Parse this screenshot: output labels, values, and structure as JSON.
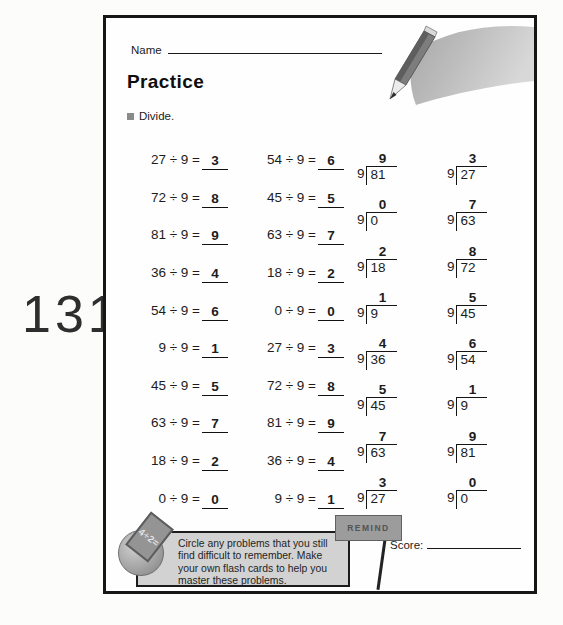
{
  "page_number": "131",
  "header": {
    "name_label": "Name",
    "title": "Practice",
    "instruction": "Divide."
  },
  "equation_rows": [
    {
      "left": {
        "expr": "27 ÷ 9 =",
        "answer": "3"
      },
      "right": {
        "expr": "54 ÷ 9 =",
        "answer": "6"
      }
    },
    {
      "left": {
        "expr": "72 ÷ 9 =",
        "answer": "8"
      },
      "right": {
        "expr": "45 ÷ 9 =",
        "answer": "5"
      }
    },
    {
      "left": {
        "expr": "81 ÷ 9 =",
        "answer": "9"
      },
      "right": {
        "expr": "63 ÷ 9 =",
        "answer": "7"
      }
    },
    {
      "left": {
        "expr": "36 ÷ 9 =",
        "answer": "4"
      },
      "right": {
        "expr": "18 ÷ 9 =",
        "answer": "2"
      }
    },
    {
      "left": {
        "expr": "54 ÷ 9 =",
        "answer": "6"
      },
      "right": {
        "expr": "0 ÷ 9 =",
        "answer": "0"
      }
    },
    {
      "left": {
        "expr": "9 ÷ 9 =",
        "answer": "1"
      },
      "right": {
        "expr": "27 ÷ 9 =",
        "answer": "3"
      }
    },
    {
      "left": {
        "expr": "45 ÷ 9 =",
        "answer": "5"
      },
      "right": {
        "expr": "72 ÷ 9 =",
        "answer": "8"
      }
    },
    {
      "left": {
        "expr": "63 ÷ 9 =",
        "answer": "7"
      },
      "right": {
        "expr": "81 ÷ 9 =",
        "answer": "9"
      }
    },
    {
      "left": {
        "expr": "18 ÷ 9 =",
        "answer": "2"
      },
      "right": {
        "expr": "36 ÷ 9 =",
        "answer": "4"
      }
    },
    {
      "left": {
        "expr": "0 ÷ 9 =",
        "answer": "0"
      },
      "right": {
        "expr": "9 ÷ 9 =",
        "answer": "1"
      }
    }
  ],
  "long_division_rows": [
    {
      "left": {
        "divisor": "9",
        "dividend": "81",
        "quotient": "9"
      },
      "right": {
        "divisor": "9",
        "dividend": "27",
        "quotient": "3"
      }
    },
    {
      "left": {
        "divisor": "9",
        "dividend": "0",
        "quotient": "0"
      },
      "right": {
        "divisor": "9",
        "dividend": "63",
        "quotient": "7"
      }
    },
    {
      "left": {
        "divisor": "9",
        "dividend": "18",
        "quotient": "2"
      },
      "right": {
        "divisor": "9",
        "dividend": "72",
        "quotient": "8"
      }
    },
    {
      "left": {
        "divisor": "9",
        "dividend": "9",
        "quotient": "1"
      },
      "right": {
        "divisor": "9",
        "dividend": "45",
        "quotient": "5"
      }
    },
    {
      "left": {
        "divisor": "9",
        "dividend": "36",
        "quotient": "4"
      },
      "right": {
        "divisor": "9",
        "dividend": "54",
        "quotient": "6"
      }
    },
    {
      "left": {
        "divisor": "9",
        "dividend": "45",
        "quotient": "5"
      },
      "right": {
        "divisor": "9",
        "dividend": "9",
        "quotient": "1"
      }
    },
    {
      "left": {
        "divisor": "9",
        "dividend": "63",
        "quotient": "7"
      },
      "right": {
        "divisor": "9",
        "dividend": "81",
        "quotient": "9"
      }
    },
    {
      "left": {
        "divisor": "9",
        "dividend": "27",
        "quotient": "3"
      },
      "right": {
        "divisor": "9",
        "dividend": "0",
        "quotient": "0"
      }
    }
  ],
  "footer": {
    "note": "Circle any problems that you still find difficult to remember. Make your own flash cards to help you master these problems.",
    "badge_text": "4÷2=",
    "sign_text": "REMIND",
    "score_label": "Score:"
  },
  "icons": {
    "pencil": "pencil-swoosh-illustration",
    "bullet": "square-bullet",
    "badge": "flash-card-ball-badge",
    "sign": "remind-sign"
  },
  "colors": {
    "page_border": "#161616",
    "note_box_bg": "#d2d2d2",
    "sign_bg": "#9c9c9c",
    "badge_bg": "#9a9a9a",
    "bullet": "#8a8a8a",
    "text": "#1c1c1c"
  }
}
